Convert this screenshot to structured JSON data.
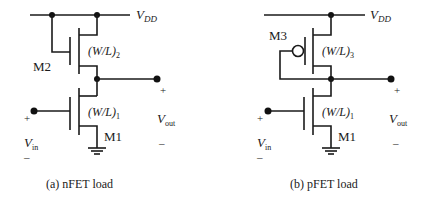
{
  "figure": {
    "panels": [
      {
        "id": "a",
        "caption": "(a)  nFET load",
        "supply_label": "V",
        "supply_sub": "DD",
        "load_transistor": {
          "name": "M2",
          "type": "nFET",
          "ratio_label": "(W/L)",
          "ratio_sub": "2"
        },
        "driver_transistor": {
          "name": "M1",
          "type": "nFET",
          "ratio_label": "(W/L)",
          "ratio_sub": "1"
        },
        "input": {
          "label": "V",
          "sub": "in",
          "plus": "+",
          "minus": "–"
        },
        "output": {
          "label": "V",
          "sub": "out",
          "plus": "+",
          "minus": "–"
        }
      },
      {
        "id": "b",
        "caption": "(b) pFET load",
        "supply_label": "V",
        "supply_sub": "DD",
        "load_transistor": {
          "name": "M3",
          "type": "pFET",
          "ratio_label": "(W/L)",
          "ratio_sub": "3"
        },
        "driver_transistor": {
          "name": "M1",
          "type": "nFET",
          "ratio_label": "(W/L)",
          "ratio_sub": "1"
        },
        "input": {
          "label": "V",
          "sub": "in",
          "plus": "+",
          "minus": "–"
        },
        "output": {
          "label": "V",
          "sub": "out",
          "plus": "+",
          "minus": "–"
        }
      }
    ],
    "colors": {
      "ink": "#1a1a1a",
      "background": "#ffffff"
    }
  }
}
